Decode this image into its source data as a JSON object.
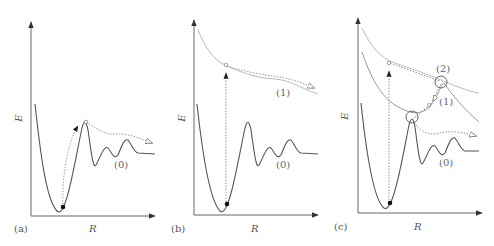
{
  "figure": {
    "panels": [
      {
        "id": "a",
        "panel_label": "(a)",
        "x_axis_label": "R",
        "y_axis_label": "E",
        "curves": [
          {
            "name": "(0)",
            "label": "(0)",
            "role": "ground-state potential with barrier and oscillations"
          }
        ],
        "description": "Excitation at the well bottom followed by tunneling/hopping over barrier along ground state (0)"
      },
      {
        "id": "b",
        "panel_label": "(b)",
        "x_axis_label": "R",
        "y_axis_label": "E",
        "curves": [
          {
            "name": "(0)",
            "label": "(0)",
            "role": "ground-state potential"
          },
          {
            "name": "(1)",
            "label": "(1)",
            "role": "excited repulsive state"
          }
        ],
        "description": "Vertical excitation from ground state (0) to excited state (1) then dissociation along (1)"
      },
      {
        "id": "c",
        "panel_label": "(c)",
        "x_axis_label": "R",
        "y_axis_label": "E",
        "curves": [
          {
            "name": "(0)",
            "label": "(0)",
            "role": "ground-state potential"
          },
          {
            "name": "(1)",
            "label": "(1)",
            "role": "first excited state"
          },
          {
            "name": "(2)",
            "label": "(2)",
            "role": "second excited state"
          }
        ],
        "crossings": [
          "(2)/(1) crossing",
          "(1)/(0) crossing"
        ],
        "description": "Vertical excitation to state (2), non-adiabatic transitions at circled crossings down to (1) and (0), then dissociation"
      }
    ],
    "colors": {
      "ground_curve": "#555555",
      "excited_curve": "#bbbbbb",
      "axis": "#666666",
      "path": "#888888",
      "marker": "#111111"
    }
  }
}
